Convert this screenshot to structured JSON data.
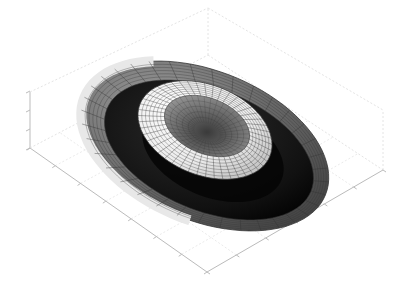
{
  "figure": {
    "background": "#ffffff",
    "width": 406,
    "height": 303
  },
  "chart_data": {
    "type": "surface3d",
    "title": "",
    "xlabel": "",
    "ylabel": "",
    "zlabel": "",
    "tick_labels_visible": false,
    "grid": true,
    "colormap": "gray",
    "edge_color": "#333333",
    "axis_color": "#bbbbbb",
    "grid_color": "#e4e4e4",
    "view": "oblique from above, elevation ~35 deg",
    "surfaces": [
      {
        "name": "outer-bowl",
        "shape": "open ellipsoidal shell (cut top)",
        "center": [
          205,
          140
        ],
        "outer_rx": 130,
        "outer_ry": 75,
        "rim_thickness": 14,
        "tilt_deg": 22,
        "shade_light": "#e6e6e6",
        "shade_dark": "#505050",
        "interior": "#111111"
      },
      {
        "name": "inner-torus",
        "shape": "torus",
        "center": [
          205,
          130
        ],
        "outer_rx": 70,
        "outer_ry": 45,
        "tube_ratio": 0.45,
        "tilt_deg": 22,
        "shade_light": "#f4f4f4",
        "shade_dark": "#8a8a8a",
        "hole": "#6f6f6f"
      }
    ],
    "axes": {
      "x_ticks": 6,
      "y_ticks": 7,
      "z_ticks": 4
    }
  }
}
